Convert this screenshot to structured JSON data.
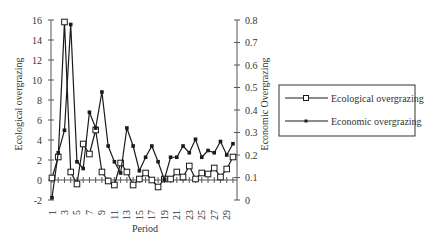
{
  "chart_data": {
    "type": "line",
    "title": "",
    "xlabel": "Period",
    "ylabel": "Ecological overgrazing",
    "ylabel_right": "Economic Overgrazing",
    "x": [
      1,
      2,
      3,
      4,
      5,
      6,
      7,
      8,
      9,
      10,
      11,
      12,
      13,
      14,
      15,
      16,
      17,
      18,
      19,
      20,
      21,
      22,
      23,
      24,
      25,
      26,
      27,
      28,
      29,
      30
    ],
    "x_tick_labels": [
      "1",
      "3",
      "5",
      "7",
      "9",
      "11",
      "13",
      "15",
      "17",
      "19",
      "21",
      "23",
      "25",
      "27",
      "29"
    ],
    "ylim": [
      -2,
      16
    ],
    "y_ticks": [
      -2,
      0,
      2,
      4,
      6,
      8,
      10,
      12,
      14,
      16
    ],
    "ylim_right": [
      0,
      0.8
    ],
    "y_ticks_right": [
      "0",
      "0.1",
      "0.2",
      "0.3",
      "0.4",
      "0.5",
      "0.6",
      "0.7",
      "0.8"
    ],
    "grid": false,
    "legend_position": "right",
    "series": [
      {
        "name": "Ecological overgrazing",
        "axis": "left",
        "marker": "open-square",
        "values": [
          0.2,
          2.3,
          15.8,
          0.8,
          -0.4,
          3.6,
          2.6,
          5.0,
          0.8,
          -0.1,
          -0.5,
          1.7,
          0.8,
          -0.5,
          0.1,
          0.7,
          0.0,
          -0.7,
          0.1,
          0.1,
          0.8,
          0.3,
          1.4,
          0.1,
          0.7,
          0.6,
          1.2,
          0.3,
          1.1,
          2.3
        ]
      },
      {
        "name": "Economic overgrazing",
        "axis": "right",
        "marker": "filled-square",
        "values": [
          0.01,
          0.21,
          0.31,
          0.78,
          0.17,
          0.14,
          0.39,
          0.32,
          0.48,
          0.24,
          0.17,
          0.12,
          0.32,
          0.24,
          0.13,
          0.19,
          0.24,
          0.17,
          0.09,
          0.19,
          0.19,
          0.24,
          0.21,
          0.27,
          0.19,
          0.22,
          0.21,
          0.26,
          0.2,
          0.25
        ]
      }
    ]
  },
  "legend": {
    "items": [
      {
        "label": "Ecological overgrazing",
        "marker": "open-square"
      },
      {
        "label": "Economic overgrazing",
        "marker": "filled-square"
      }
    ]
  },
  "colors": {
    "line": "#1a1a1a",
    "axis": "#555555",
    "text": "#333333",
    "background": "#ffffff"
  }
}
